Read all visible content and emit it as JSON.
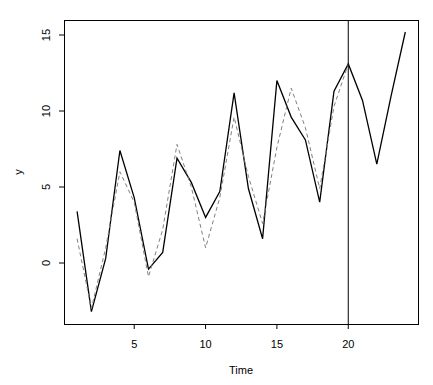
{
  "chart_data": {
    "type": "line",
    "title": "",
    "xlabel": "Time",
    "ylabel": "y",
    "xlim": [
      0.1,
      24.9
    ],
    "ylim": [
      -5.4,
      16.0
    ],
    "grid": false,
    "legend": null,
    "x_ticks": [
      5,
      10,
      15,
      20
    ],
    "y_ticks": [
      0,
      5,
      10,
      15
    ],
    "x_tick_labels": [
      "5",
      "10",
      "15",
      "20"
    ],
    "y_tick_labels": [
      "0",
      "5",
      "10",
      "15"
    ],
    "vertical_line": {
      "x": 20,
      "style": "solid",
      "color": "#000000"
    },
    "series": [
      {
        "name": "observed",
        "style": "solid",
        "color": "#000000",
        "x": [
          1,
          2,
          3,
          4,
          5,
          6,
          7,
          8,
          9,
          10,
          11,
          12,
          13,
          14,
          15,
          16,
          17,
          18,
          19,
          20,
          21,
          22,
          23,
          24
        ],
        "values": [
          3.4,
          -3.2,
          0.3,
          7.4,
          4.3,
          -0.4,
          0.7,
          6.9,
          5.3,
          3.0,
          4.7,
          11.2,
          4.9,
          1.6,
          12.0,
          9.6,
          8.1,
          4.0,
          11.3,
          13.1,
          10.7,
          6.5,
          11.0,
          15.2
        ]
      },
      {
        "name": "fitted",
        "style": "dashed",
        "color": "#808080",
        "x": [
          1,
          2,
          3,
          4,
          5,
          6,
          7,
          8,
          9,
          10,
          11,
          12,
          13,
          14,
          15,
          16,
          17,
          18,
          19,
          20
        ],
        "values": [
          1.6,
          -3.0,
          1.0,
          6.0,
          4.0,
          -0.9,
          2.2,
          7.8,
          5.0,
          1.0,
          4.3,
          9.6,
          5.7,
          2.6,
          7.6,
          11.5,
          8.9,
          4.9,
          10.3,
          13.1
        ]
      }
    ]
  },
  "layout": {
    "plot_left": 64,
    "plot_right": 418,
    "plot_top": 20,
    "plot_bottom": 324,
    "x0_px": 64,
    "x_px_per_unit": 14.27,
    "x_origin_value": 0.0,
    "y0_px": 263,
    "y_px_per_unit": 15.2
  }
}
